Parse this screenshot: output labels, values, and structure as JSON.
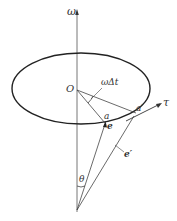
{
  "diagram": {
    "labels": {
      "omega_axis": "ω",
      "origin": "O",
      "angle": "ωΔt",
      "point_a": "a",
      "point_a_prime": "a′",
      "tangent": "τ",
      "vector_e": "e",
      "vector_e_prime": "e′",
      "cone_angle": "θ"
    },
    "colors": {
      "stroke": "#2a2a2a",
      "axis": "#555555",
      "text": "#333333"
    }
  }
}
